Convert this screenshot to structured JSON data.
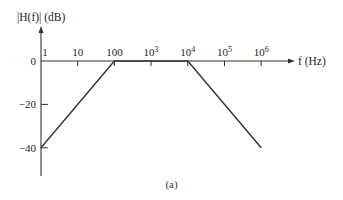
{
  "chart_data": {
    "type": "line",
    "title": "",
    "ylabel": "|H(f)| (dB)",
    "xlabel": "f (Hz)",
    "xscale": "log",
    "x_ticks": [
      {
        "value": 1,
        "label": "1"
      },
      {
        "value": 10,
        "label": "10"
      },
      {
        "value": 100,
        "label": "100"
      },
      {
        "value": 1000,
        "label": "10",
        "sup": "3"
      },
      {
        "value": 10000,
        "label": "10",
        "sup": "4"
      },
      {
        "value": 100000,
        "label": "10",
        "sup": "5"
      },
      {
        "value": 1000000,
        "label": "10",
        "sup": "6"
      }
    ],
    "y_ticks": [
      {
        "value": 0,
        "label": "0"
      },
      {
        "value": -20,
        "label": "−20"
      },
      {
        "value": -40,
        "label": "−40"
      }
    ],
    "xlim": [
      1,
      1000000
    ],
    "ylim": [
      -50,
      20
    ],
    "grid": false,
    "legend": null,
    "series": [
      {
        "name": "Bode magnitude (asymptotic)",
        "x": [
          1,
          100,
          10000,
          1000000
        ],
        "y": [
          -40,
          0,
          0,
          -40
        ]
      }
    ],
    "caption": "(a)"
  }
}
